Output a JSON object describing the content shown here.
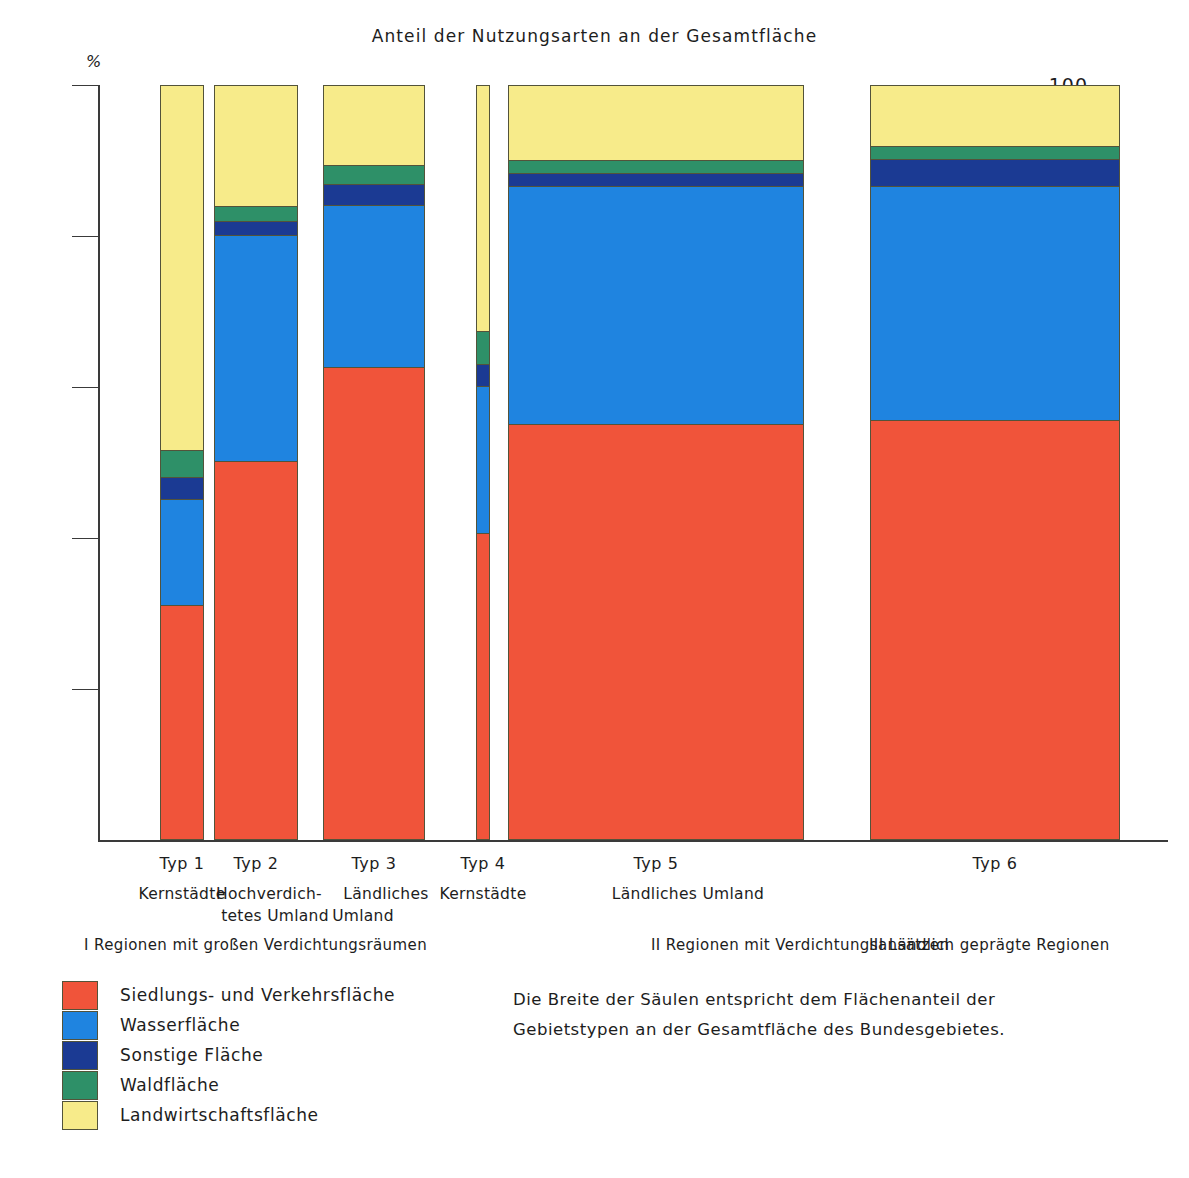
{
  "chart": {
    "title": "Anteil der Nutzungsarten an der Gesamtfläche",
    "unit": "%"
  },
  "axis": {
    "ticks": [
      "100",
      "80",
      "60",
      "40",
      "20"
    ]
  },
  "note": {
    "line1": "Die Breite der Säulen entspricht dem Flächenanteil der",
    "line2": "Gebietstypen an der Gesamtfläche des Bundesgebietes."
  },
  "groups": [
    {
      "label": "I Regionen mit großen Verdichtungsräumen"
    },
    {
      "label": "II Regionen mit Verdichtungsansätzen"
    },
    {
      "label": "III Ländlich geprägte Regionen"
    }
  ],
  "legend": [
    {
      "label": "Siedlungs- und Verkehrsfläche",
      "color": "#f0543a"
    },
    {
      "label": "Wasserfläche",
      "color": "#1f84e0"
    },
    {
      "label": "Sonstige Fläche",
      "color": "#1b3a93"
    },
    {
      "label": "Waldfläche",
      "color": "#2e9068"
    },
    {
      "label": "Landwirtschaftsfläche",
      "color": "#f7eb8a"
    }
  ],
  "chart_data": {
    "type": "bar",
    "title": "Anteil der Nutzungsarten an der Gesamtfläche",
    "xlabel": "",
    "ylabel": "%",
    "ylim": [
      0,
      100
    ],
    "grid": false,
    "stacked": true,
    "legend_position": "bottom-left",
    "annotation": "Die Breite der Säulen entspricht dem Flächenanteil der Gebietstypen an der Gesamtfläche des Bundesgebietes.",
    "categories": [
      "Typ 1",
      "Typ 2",
      "Typ 3",
      "Typ 4",
      "Typ 5",
      "Typ 6"
    ],
    "category_sublabels": [
      "Kernstädte",
      "Hochverdich-\ntetes Umland",
      "Ländliches\nUmland",
      "Kernstädte",
      "Ländliches Umland",
      ""
    ],
    "bar_widths_percent_of_area": [
      7.0,
      11.0,
      12.0,
      2.0,
      33.0,
      27.0
    ],
    "series": [
      {
        "name": "Siedlungs- und Verkehrsfläche",
        "color": "#f0543a",
        "values": [
          31.0,
          50.0,
          62.5,
          40.5,
          55.0,
          55.5
        ]
      },
      {
        "name": "Wasserfläche",
        "color": "#1f84e0",
        "values": [
          14.0,
          30.0,
          21.5,
          19.5,
          31.5,
          31.0
        ]
      },
      {
        "name": "Sonstige Fläche",
        "color": "#1b3a93",
        "values": [
          2.9,
          1.9,
          2.8,
          2.9,
          1.7,
          3.6
        ]
      },
      {
        "name": "Waldfläche",
        "color": "#2e9068",
        "values": [
          3.6,
          2.0,
          2.5,
          4.4,
          1.8,
          1.7
        ]
      },
      {
        "name": "Landwirtschaftsfläche",
        "color": "#f7eb8a",
        "values": [
          48.5,
          16.1,
          10.7,
          32.7,
          10.0,
          8.2
        ]
      }
    ]
  },
  "bars": [
    {
      "typ": "Typ 1",
      "sub1": "Kernstädte",
      "sub2": "",
      "left": 62,
      "width": 44
    },
    {
      "typ": "Typ 2",
      "sub1": "Hochverdich-",
      "sub2": "tetes Umland",
      "left": 116,
      "width": 84
    },
    {
      "typ": "Typ 3",
      "sub1": "Ländliches",
      "sub2": "Umland",
      "left": 225,
      "width": 102
    },
    {
      "typ": "Typ 4",
      "sub1": "Kernstädte",
      "sub2": "",
      "left": 378,
      "width": 14
    },
    {
      "typ": "Typ 5",
      "sub1": "Ländliches Umland",
      "sub2": "",
      "left": 410,
      "width": 296
    },
    {
      "typ": "Typ 6",
      "sub1": "",
      "sub2": "",
      "left": 772,
      "width": 250
    }
  ]
}
